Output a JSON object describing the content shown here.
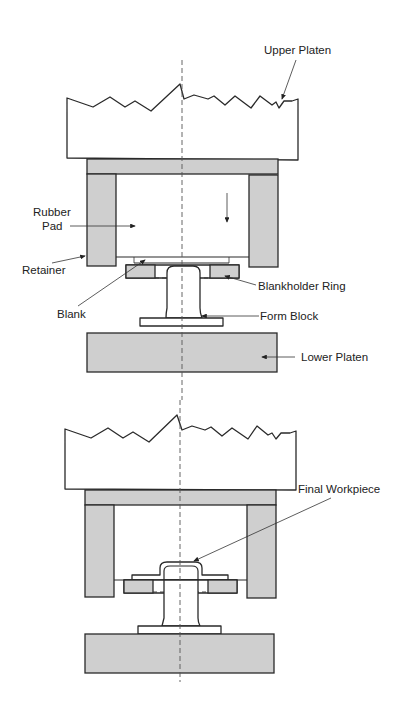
{
  "diagram": {
    "type": "rubber-pad forming press cross-section",
    "stages": [
      {
        "id": "before",
        "labels": {
          "upper_platen": "Upper Platen",
          "rubber_pad_line1": "Rubber",
          "rubber_pad_line2": "Pad",
          "retainer": "Retainer",
          "blank": "Blank",
          "blankholder_ring": "Blankholder Ring",
          "form_block": "Form Block",
          "lower_platen": "Lower Platen"
        },
        "motion": "downward-arrow"
      },
      {
        "id": "after",
        "labels": {
          "final_workpiece": "Final Workpiece"
        }
      }
    ],
    "colors": {
      "fill_gray": "#cfcfcf",
      "stroke": "#2a2a2a",
      "background": "#ffffff"
    }
  }
}
